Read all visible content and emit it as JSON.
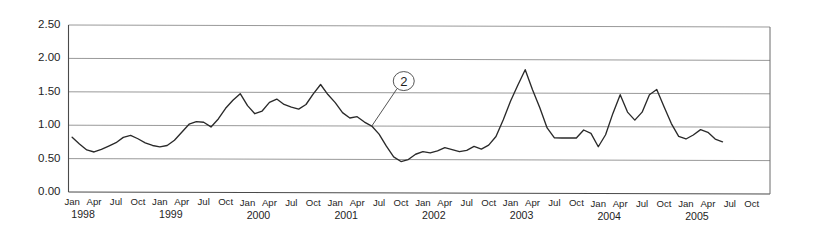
{
  "chart_data": {
    "type": "line",
    "title": "",
    "subtitle": "",
    "xlabel": "",
    "ylabel": "",
    "ylim": [
      0.0,
      2.5
    ],
    "ytick_labels": [
      "0.00",
      "0.50",
      "1.00",
      "1.50",
      "2.00",
      "2.50"
    ],
    "ytick_values": [
      0.0,
      0.5,
      1.0,
      1.5,
      2.0,
      2.5
    ],
    "grid": true,
    "legend": "none",
    "x_start": "1998-01",
    "x_end": "2005-12",
    "xtick_months": [
      "Jan",
      "Apr",
      "Jul",
      "Oct"
    ],
    "xtick_years": [
      "1998",
      "1999",
      "2000",
      "2001",
      "2002",
      "2003",
      "2004",
      "2005"
    ],
    "xtick_labels": [
      "Jan",
      "Apr",
      "Jul",
      "Oct",
      "Jan",
      "Apr",
      "Jul",
      "Oct",
      "Jan",
      "Apr",
      "Jul",
      "Oct",
      "Jan",
      "Apr",
      "Jul",
      "Oct",
      "Jan",
      "Apr",
      "Jul",
      "Oct",
      "Jan",
      "Apr",
      "Jul",
      "Oct",
      "Jan",
      "Apr",
      "Jul",
      "Oct",
      "Jan",
      "Apr",
      "Jul",
      "Oct"
    ],
    "series": [
      {
        "name": "series-1",
        "color": "#2a2a2a",
        "x": [
          "1998-01",
          "1998-02",
          "1998-03",
          "1998-04",
          "1998-05",
          "1998-06",
          "1998-07",
          "1998-08",
          "1998-09",
          "1998-10",
          "1998-11",
          "1998-12",
          "1999-01",
          "1999-02",
          "1999-03",
          "1999-04",
          "1999-05",
          "1999-06",
          "1999-07",
          "1999-08",
          "1999-09",
          "1999-10",
          "1999-11",
          "1999-12",
          "2000-01",
          "2000-02",
          "2000-03",
          "2000-04",
          "2000-05",
          "2000-06",
          "2000-07",
          "2000-08",
          "2000-09",
          "2000-10",
          "2000-11",
          "2000-12",
          "2001-01",
          "2001-02",
          "2001-03",
          "2001-04",
          "2001-05",
          "2001-06",
          "2001-07",
          "2001-08",
          "2001-09",
          "2001-10",
          "2001-11",
          "2001-12",
          "2002-01",
          "2002-02",
          "2002-03",
          "2002-04",
          "2002-05",
          "2002-06",
          "2002-07",
          "2002-08",
          "2002-09",
          "2002-10",
          "2002-11",
          "2002-12",
          "2003-01",
          "2003-02",
          "2003-03",
          "2003-04",
          "2003-05",
          "2003-06",
          "2003-07",
          "2003-08",
          "2003-09",
          "2003-10",
          "2003-11",
          "2003-12",
          "2004-01",
          "2004-02",
          "2004-03",
          "2004-04",
          "2004-05",
          "2004-06",
          "2004-07",
          "2004-08",
          "2004-09",
          "2004-10",
          "2004-11",
          "2004-12",
          "2005-01",
          "2005-02",
          "2005-03",
          "2005-04",
          "2005-05",
          "2005-06"
        ],
        "values": [
          0.82,
          0.72,
          0.63,
          0.6,
          0.64,
          0.69,
          0.74,
          0.82,
          0.85,
          0.8,
          0.74,
          0.7,
          0.68,
          0.7,
          0.78,
          0.9,
          1.02,
          1.06,
          1.05,
          0.98,
          1.1,
          1.26,
          1.38,
          1.48,
          1.3,
          1.18,
          1.22,
          1.35,
          1.4,
          1.32,
          1.28,
          1.25,
          1.32,
          1.48,
          1.62,
          1.47,
          1.35,
          1.2,
          1.12,
          1.14,
          1.06,
          1.0,
          0.88,
          0.7,
          0.54,
          0.47,
          0.5,
          0.58,
          0.62,
          0.6,
          0.63,
          0.68,
          0.65,
          0.62,
          0.64,
          0.7,
          0.66,
          0.72,
          0.85,
          1.1,
          1.38,
          1.62,
          1.85,
          1.55,
          1.28,
          0.98,
          0.83,
          0.83,
          0.83,
          0.83,
          0.95,
          0.9,
          0.7,
          0.88,
          1.2,
          1.48,
          1.22,
          1.1,
          1.22,
          1.48,
          1.56,
          1.3,
          1.05,
          0.86,
          0.82,
          0.88,
          0.96,
          0.92,
          0.82,
          0.78
        ]
      }
    ],
    "annotations": [
      {
        "label": "2",
        "shape": "circled-number",
        "target_point": "2001-06",
        "target_value": 1.0
      }
    ]
  }
}
